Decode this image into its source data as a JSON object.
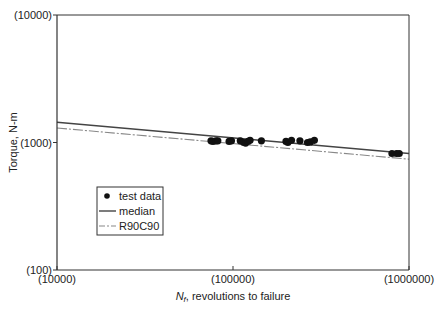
{
  "chart_data": {
    "type": "scatter",
    "title": "",
    "xlabel": "N_f, revolutions to failure",
    "xlabel_italic": "N",
    "xlabel_sub": "f",
    "xlabel_rest": ", revolutions to failure",
    "ylabel": "Torque, N-m",
    "xscale": "log",
    "yscale": "log",
    "xlim": [
      10000,
      1000000
    ],
    "ylim": [
      100,
      10000
    ],
    "x_ticks": [
      "(10000)",
      "(100000)",
      "(1000000)"
    ],
    "y_ticks": [
      "(100)",
      "(1000)",
      "(10000)"
    ],
    "grid": false,
    "legend_position": "lower left",
    "legend": [
      "test data",
      "median",
      "R90C90"
    ],
    "series": [
      {
        "name": "test data",
        "kind": "points",
        "x": [
          75000,
          77000,
          80000,
          82000,
          95000,
          98000,
          110000,
          115000,
          118000,
          122000,
          125000,
          145000,
          200000,
          205000,
          215000,
          240000,
          265000,
          275000,
          290000,
          800000,
          850000,
          880000
        ],
        "y": [
          1030,
          1020,
          1030,
          1030,
          1020,
          1030,
          1030,
          1000,
          990,
          1020,
          1040,
          1030,
          1020,
          1000,
          1040,
          1030,
          1000,
          1010,
          1040,
          820,
          820,
          820
        ]
      },
      {
        "name": "median",
        "kind": "line",
        "x": [
          10000,
          1000000
        ],
        "y": [
          1440,
          820
        ]
      },
      {
        "name": "R90C90",
        "kind": "dashed-line",
        "x": [
          10000,
          1000000
        ],
        "y": [
          1300,
          740
        ]
      }
    ],
    "colors": {
      "axis": "#333333",
      "median": "#444444",
      "r90c90": "#888888",
      "points": "#111111"
    }
  }
}
